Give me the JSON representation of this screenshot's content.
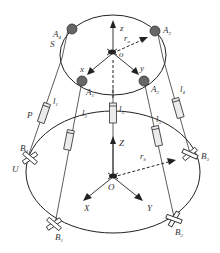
{
  "diagram": {
    "upper_platform": {
      "label": "S",
      "origin_label": "o",
      "axes": {
        "x": "x",
        "y": "y",
        "z": "z"
      },
      "radius_label": "r",
      "radius_sub": "a",
      "joints": [
        {
          "id": "A1",
          "label": "A",
          "sub": "1"
        },
        {
          "id": "A2",
          "label": "A",
          "sub": "2"
        },
        {
          "id": "A3",
          "label": "A",
          "sub": "3"
        },
        {
          "id": "A4",
          "label": "A",
          "sub": "4"
        }
      ]
    },
    "base_platform": {
      "origin_label": "O",
      "axes": {
        "X": "X",
        "Y": "Y",
        "Z": "Z"
      },
      "radius_label": "r",
      "radius_sub": "b",
      "joint_type_label": "U",
      "joints": [
        {
          "id": "B1",
          "label": "B",
          "sub": "1"
        },
        {
          "id": "B2",
          "label": "B",
          "sub": "2"
        },
        {
          "id": "B3",
          "label": "B",
          "sub": "3"
        },
        {
          "id": "B4",
          "label": "B",
          "sub": "4"
        }
      ]
    },
    "legs": [
      {
        "label": "l",
        "sub": "1"
      },
      {
        "label": "l",
        "sub": "2"
      },
      {
        "label": "l",
        "sub": "3"
      },
      {
        "label": "l",
        "sub": "4"
      },
      {
        "label": "l",
        "sub": "5"
      }
    ],
    "prismatic_label": "P"
  }
}
